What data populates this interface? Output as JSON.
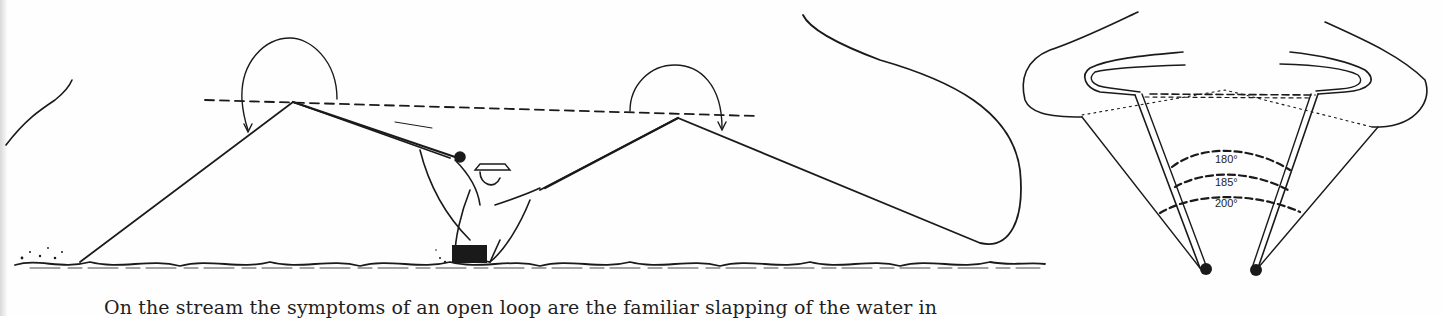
{
  "page": {
    "figure_left": {
      "description": "fly caster kneeling in stream with rod motions illustrated"
    },
    "figure_right": {
      "description": "casting arc diagram showing loop angles",
      "angle_labels": [
        "180°",
        "185°",
        "200°"
      ]
    },
    "body_text": "On the stream the symptoms of an open loop are the familiar slapping of the water in"
  },
  "colors": {
    "ink": "#1a1a1a",
    "paper": "#fefefe"
  }
}
